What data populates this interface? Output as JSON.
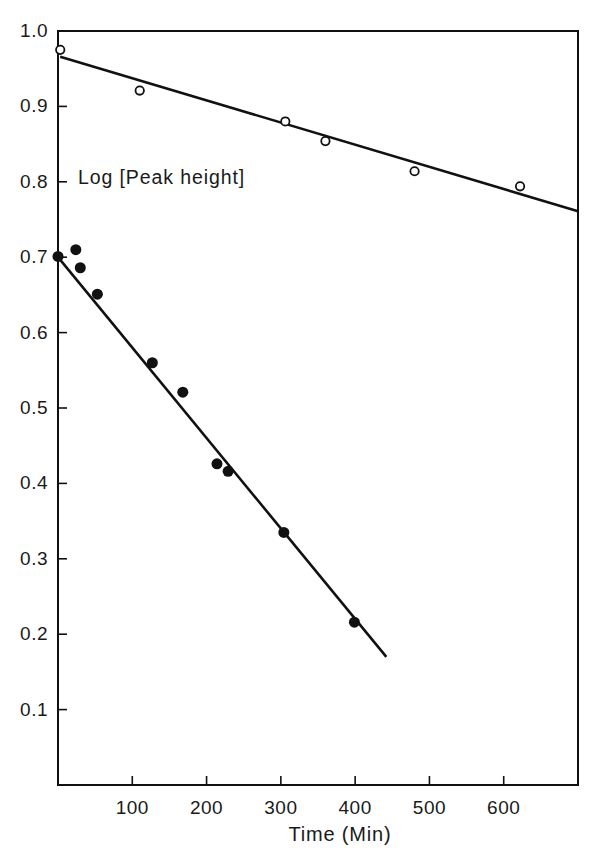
{
  "figure": {
    "background_color": "#ffffff",
    "ink_color": "#111111",
    "width": 596,
    "height": 857
  },
  "annotations": {
    "plot_label": "Log [Peak height]"
  },
  "chart_data": {
    "type": "scatter",
    "title": "",
    "subtitle": "",
    "xlabel": "Time (Min)",
    "ylabel": "Log [Peak height]",
    "xlim": [
      0,
      700
    ],
    "ylim": [
      0.0,
      1.0
    ],
    "grid": false,
    "legend_position": "none",
    "x_ticks": [
      100,
      200,
      300,
      400,
      500,
      600
    ],
    "x_tick_labels": [
      "100",
      "200",
      "300",
      "400",
      "500",
      "600"
    ],
    "y_ticks": [
      0.1,
      0.2,
      0.3,
      0.4,
      0.5,
      0.6,
      0.7,
      0.8,
      0.9,
      1.0
    ],
    "y_tick_labels": [
      "0.1",
      "0.2",
      "0.3",
      "0.4",
      "0.5",
      "0.6",
      "0.7",
      "0.8",
      "0.9",
      "1.0"
    ],
    "series": [
      {
        "name": "open-circles",
        "marker": "open-circle",
        "marker_size": 10,
        "color": "#111111",
        "points": [
          {
            "x": 3,
            "y": 0.975
          },
          {
            "x": 110,
            "y": 0.921
          },
          {
            "x": 306,
            "y": 0.88
          },
          {
            "x": 360,
            "y": 0.854
          },
          {
            "x": 480,
            "y": 0.814
          },
          {
            "x": 622,
            "y": 0.794
          }
        ],
        "fit_line": {
          "x0": 3,
          "y0": 0.966,
          "x1": 700,
          "y1": 0.761
        }
      },
      {
        "name": "filled-circles",
        "marker": "filled-circle",
        "marker_size": 11,
        "color": "#111111",
        "points": [
          {
            "x": 0,
            "y": 0.701
          },
          {
            "x": 24,
            "y": 0.71
          },
          {
            "x": 30,
            "y": 0.686
          },
          {
            "x": 53,
            "y": 0.651
          },
          {
            "x": 127,
            "y": 0.56
          },
          {
            "x": 168,
            "y": 0.521
          },
          {
            "x": 214,
            "y": 0.426
          },
          {
            "x": 229,
            "y": 0.416
          },
          {
            "x": 304,
            "y": 0.335
          },
          {
            "x": 399,
            "y": 0.216
          }
        ],
        "fit_line": {
          "x0": 0,
          "y0": 0.7,
          "x1": 442,
          "y1": 0.17
        }
      }
    ]
  }
}
